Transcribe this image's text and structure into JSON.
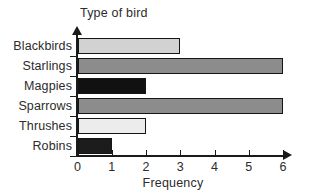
{
  "chart_data": {
    "type": "bar",
    "orientation": "horizontal",
    "title": "",
    "xlabel": "Frequency",
    "ylabel": "Type of bird",
    "categories": [
      "Blackbirds",
      "Starlings",
      "Magpies",
      "Sparrows",
      "Thrushes",
      "Robins"
    ],
    "values": [
      3,
      6,
      2,
      6,
      2,
      1
    ],
    "bar_colors": [
      "#d2d2d2",
      "#8c8c8c",
      "#111111",
      "#8c8c8c",
      "#ececec",
      "#1c1c1c"
    ],
    "xlim": [
      0,
      6
    ],
    "xticks": [
      0,
      1,
      2,
      3,
      4,
      5,
      6
    ],
    "xtick_labels": [
      "0",
      "1",
      "2",
      "3",
      "4",
      "5",
      "6"
    ],
    "grid": false,
    "legend": null,
    "axis_color": "#1a1a1a",
    "background": "#ffffff"
  }
}
